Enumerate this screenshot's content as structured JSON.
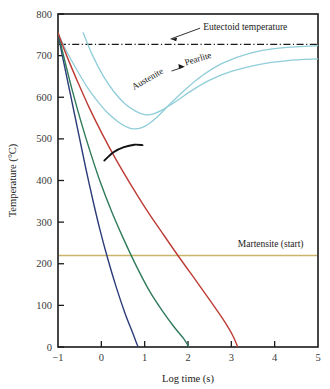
{
  "chart_data": {
    "type": "line",
    "title": "",
    "xlabel": "Log time (s)",
    "ylabel": "Temperature (°C)",
    "xlim": [
      -1,
      5
    ],
    "ylim": [
      0,
      800
    ],
    "xticks": [
      -1,
      0,
      1,
      2,
      3,
      4,
      5
    ],
    "xtick_labels": [
      "−1",
      "0",
      "1",
      "2",
      "3",
      "4",
      "5"
    ],
    "yticks": [
      0,
      100,
      200,
      300,
      400,
      500,
      600,
      700,
      800
    ],
    "ytick_labels": [
      "0",
      "100",
      "200",
      "300",
      "400",
      "500",
      "600",
      "700",
      "800"
    ],
    "grid": false,
    "legend": "none",
    "annotations": [
      {
        "name": "eutectoid-temperature-label",
        "text": "Eutectoid temperature",
        "x": 2.35,
        "y": 770
      },
      {
        "name": "austenite-label",
        "text": "Austenite",
        "x": 1.1,
        "y": 638
      },
      {
        "name": "pearlite-label",
        "text": "Pearlite",
        "x": 2.25,
        "y": 686
      },
      {
        "name": "martensite-start-label",
        "text": "Martensite (start)",
        "x": 3.15,
        "y": 248
      }
    ],
    "reference_lines": [
      {
        "name": "eutectoid-temperature-line",
        "value": 727,
        "orientation": "horizontal",
        "style": "dash-dot",
        "color": "#1a1a1a"
      },
      {
        "name": "martensite-start-line",
        "value": 220,
        "orientation": "horizontal",
        "style": "solid",
        "color": "#c9b46a"
      }
    ],
    "series": [
      {
        "name": "austenite-to-pearlite-start",
        "label": "Austenite start (TTT nose, outer)",
        "color": "#8fcdd8",
        "style": "solid",
        "points": [
          [
            -1,
            755
          ],
          [
            -0.85,
            720
          ],
          [
            -0.6,
            672
          ],
          [
            -0.35,
            628
          ],
          [
            -0.1,
            592
          ],
          [
            0.15,
            562
          ],
          [
            0.4,
            540
          ],
          [
            0.62,
            527
          ],
          [
            0.8,
            524
          ],
          [
            1.0,
            530
          ],
          [
            1.25,
            549
          ],
          [
            1.55,
            580
          ],
          [
            1.9,
            615
          ],
          [
            2.3,
            650
          ],
          [
            2.8,
            682
          ],
          [
            3.4,
            705
          ],
          [
            4.1,
            718
          ],
          [
            5,
            724
          ]
        ]
      },
      {
        "name": "austenite-to-pearlite-finish",
        "label": "Pearlite finish (TTT nose, inner)",
        "color": "#8fcdd8",
        "style": "solid",
        "points": [
          [
            -0.42,
            755
          ],
          [
            -0.2,
            700
          ],
          [
            0.05,
            650
          ],
          [
            0.3,
            612
          ],
          [
            0.55,
            584
          ],
          [
            0.8,
            566
          ],
          [
            1.0,
            558
          ],
          [
            1.2,
            560
          ],
          [
            1.45,
            572
          ],
          [
            1.75,
            592
          ],
          [
            2.1,
            617
          ],
          [
            2.5,
            641
          ],
          [
            3.0,
            662
          ],
          [
            3.6,
            678
          ],
          [
            4.3,
            688
          ],
          [
            5,
            692
          ]
        ]
      },
      {
        "name": "cooling-curve-fast",
        "label": "Rapid cooling curve (water quench)",
        "color": "#2d3c78",
        "style": "solid",
        "points": [
          [
            -1,
            755
          ],
          [
            -0.9,
            700
          ],
          [
            -0.78,
            640
          ],
          [
            -0.64,
            570
          ],
          [
            -0.5,
            500
          ],
          [
            -0.36,
            430
          ],
          [
            -0.2,
            355
          ],
          [
            -0.04,
            285
          ],
          [
            0.14,
            215
          ],
          [
            0.34,
            145
          ],
          [
            0.55,
            80
          ],
          [
            0.72,
            35
          ],
          [
            0.83,
            5
          ],
          [
            0.86,
            0
          ]
        ]
      },
      {
        "name": "cooling-curve-medium",
        "label": "Moderate cooling curve (oil quench)",
        "color": "#2f7a5a",
        "style": "solid",
        "points": [
          [
            -1,
            755
          ],
          [
            -0.85,
            690
          ],
          [
            -0.68,
            620
          ],
          [
            -0.48,
            545
          ],
          [
            -0.26,
            470
          ],
          [
            -0.02,
            395
          ],
          [
            0.24,
            325
          ],
          [
            0.52,
            258
          ],
          [
            0.82,
            192
          ],
          [
            1.12,
            133
          ],
          [
            1.42,
            85
          ],
          [
            1.68,
            48
          ],
          [
            1.9,
            20
          ],
          [
            2.02,
            0
          ]
        ]
      },
      {
        "name": "cooling-curve-slow",
        "label": "Slow cooling curve (air cool)",
        "color": "#bc3b34",
        "style": "solid",
        "points": [
          [
            -1,
            755
          ],
          [
            -0.8,
            700
          ],
          [
            -0.55,
            638
          ],
          [
            -0.28,
            575
          ],
          [
            0.02,
            512
          ],
          [
            0.34,
            450
          ],
          [
            0.68,
            390
          ],
          [
            1.04,
            330
          ],
          [
            1.42,
            272
          ],
          [
            1.8,
            215
          ],
          [
            2.18,
            160
          ],
          [
            2.52,
            110
          ],
          [
            2.8,
            68
          ],
          [
            3.02,
            30
          ],
          [
            3.15,
            0
          ]
        ]
      }
    ],
    "markers": [
      {
        "name": "transformation-arc",
        "label": "",
        "color": "#111111",
        "points": [
          [
            0.07,
            448
          ],
          [
            0.28,
            468
          ],
          [
            0.52,
            480
          ],
          [
            0.76,
            486
          ],
          [
            0.95,
            485
          ]
        ]
      }
    ]
  }
}
